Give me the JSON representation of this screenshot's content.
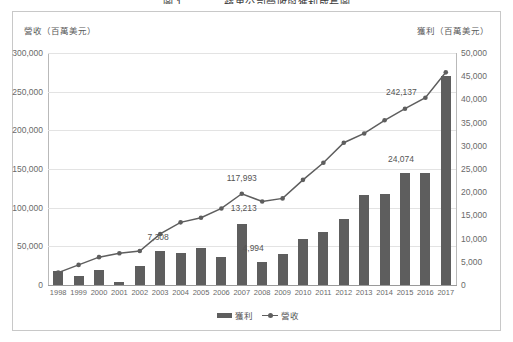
{
  "figure": {
    "caption": "圖 1　　　　蘋果公司營收與獲利成長圖"
  },
  "axes": {
    "left_header": "營收（百萬美元）",
    "right_header": "獲利（百萬美元）",
    "left_ticks": [
      "300,000",
      "250,000",
      "200,000",
      "150,000",
      "100,000",
      "50,000",
      "0"
    ],
    "right_ticks": [
      "50,000",
      "45,000",
      "40,000",
      "35,000",
      "30,000",
      "25,000",
      "20,000",
      "15,000",
      "10,000",
      "5,000",
      "0"
    ]
  },
  "legend": {
    "bar_label": "獲利",
    "line_label": "營收"
  },
  "colors": {
    "series": "#5e5e5e",
    "grid": "#e3e3e3",
    "frame": "#c8c8c8",
    "text": "#5a5a5a"
  },
  "chart_data": {
    "type": "bar",
    "title": "圖 1　　　　蘋果公司營收與獲利成長圖",
    "xlabel": "",
    "ylabel": "營收（百萬美元）",
    "y2label": "獲利（百萬美元）",
    "grid": true,
    "legend_position": "bottom",
    "ylim": [
      0,
      300000
    ],
    "y2lim": [
      0,
      50000
    ],
    "categories": [
      "1998",
      "1999",
      "2000",
      "2001",
      "2002",
      "2003",
      "2004",
      "2005",
      "2006",
      "2007",
      "2008",
      "2009",
      "2010",
      "2011",
      "2012",
      "2013",
      "2014",
      "2015",
      "2016",
      "2017"
    ],
    "series": [
      {
        "name": "獲利",
        "type": "bar",
        "axis": "right",
        "values": [
          3100,
          1900,
          3300,
          700,
          4100,
          7308,
          7000,
          8000,
          6000,
          13213,
          4994,
          6700,
          10000,
          11500,
          14200,
          19300,
          19700,
          24074,
          24074,
          45000
        ]
      },
      {
        "name": "營收",
        "type": "line",
        "axis": "left",
        "values": [
          16000,
          26000,
          36000,
          41000,
          44000,
          66000,
          81000,
          87000,
          99000,
          117993,
          108000,
          112000,
          136000,
          158000,
          184000,
          196000,
          213000,
          228000,
          242137,
          275000
        ]
      }
    ],
    "annotations": [
      {
        "label": "7,308",
        "series": "獲利",
        "category": "2003"
      },
      {
        "label": "13,213",
        "series": "獲利",
        "category": "2007"
      },
      {
        "label": "4,994",
        "series": "獲利",
        "category": "2008"
      },
      {
        "label": "24,074",
        "series": "獲利",
        "category": "2015"
      },
      {
        "label": "117,993",
        "series": "營收",
        "category": "2007"
      },
      {
        "label": "242,137",
        "series": "營收",
        "category": "2016"
      }
    ]
  }
}
